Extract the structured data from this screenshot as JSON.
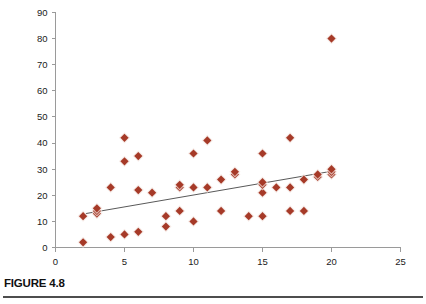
{
  "caption": {
    "label": "FIGURE 4.8"
  },
  "colors": {
    "marker": "#A63A28",
    "marker_halo": "#F3E4DF",
    "trend_line": "#595959",
    "axis": "#9A9A9A",
    "tick_text": "#1A1A1A",
    "caption_text": "#111111",
    "rule": "#4D4D4D",
    "background": "#FFFFFF"
  },
  "chart_data": {
    "type": "scatter",
    "title": "",
    "xlabel": "",
    "ylabel": "",
    "xlim": [
      0,
      25
    ],
    "ylim": [
      0,
      90
    ],
    "xticks": [
      0,
      5,
      10,
      15,
      20,
      25
    ],
    "yticks": [
      0,
      10,
      20,
      30,
      40,
      50,
      60,
      70,
      80,
      90
    ],
    "grid": false,
    "legend": null,
    "marker_shape": "diamond",
    "points": [
      {
        "x": 2,
        "y": 2
      },
      {
        "x": 2,
        "y": 12
      },
      {
        "x": 3,
        "y": 13
      },
      {
        "x": 3,
        "y": 14
      },
      {
        "x": 3,
        "y": 15
      },
      {
        "x": 4,
        "y": 4
      },
      {
        "x": 4,
        "y": 23
      },
      {
        "x": 5,
        "y": 5
      },
      {
        "x": 5,
        "y": 33
      },
      {
        "x": 5,
        "y": 42
      },
      {
        "x": 6,
        "y": 6
      },
      {
        "x": 6,
        "y": 22
      },
      {
        "x": 6,
        "y": 35
      },
      {
        "x": 7,
        "y": 21
      },
      {
        "x": 8,
        "y": 8
      },
      {
        "x": 8,
        "y": 12
      },
      {
        "x": 9,
        "y": 14
      },
      {
        "x": 9,
        "y": 23
      },
      {
        "x": 9,
        "y": 24
      },
      {
        "x": 10,
        "y": 10
      },
      {
        "x": 10,
        "y": 23
      },
      {
        "x": 10,
        "y": 36
      },
      {
        "x": 11,
        "y": 23
      },
      {
        "x": 11,
        "y": 41
      },
      {
        "x": 12,
        "y": 14
      },
      {
        "x": 12,
        "y": 26
      },
      {
        "x": 13,
        "y": 28
      },
      {
        "x": 13,
        "y": 29
      },
      {
        "x": 14,
        "y": 12
      },
      {
        "x": 15,
        "y": 12
      },
      {
        "x": 15,
        "y": 21
      },
      {
        "x": 15,
        "y": 24
      },
      {
        "x": 15,
        "y": 25
      },
      {
        "x": 15,
        "y": 36
      },
      {
        "x": 16,
        "y": 23
      },
      {
        "x": 17,
        "y": 14
      },
      {
        "x": 17,
        "y": 23
      },
      {
        "x": 17,
        "y": 42
      },
      {
        "x": 18,
        "y": 14
      },
      {
        "x": 18,
        "y": 26
      },
      {
        "x": 19,
        "y": 27
      },
      {
        "x": 19,
        "y": 28
      },
      {
        "x": 20,
        "y": 28
      },
      {
        "x": 20,
        "y": 29
      },
      {
        "x": 20,
        "y": 30
      },
      {
        "x": 20,
        "y": 80
      }
    ],
    "trend_line": {
      "x_start": 2.2,
      "y_start": 13.0,
      "x_end": 20.0,
      "y_end": 29.2
    }
  }
}
